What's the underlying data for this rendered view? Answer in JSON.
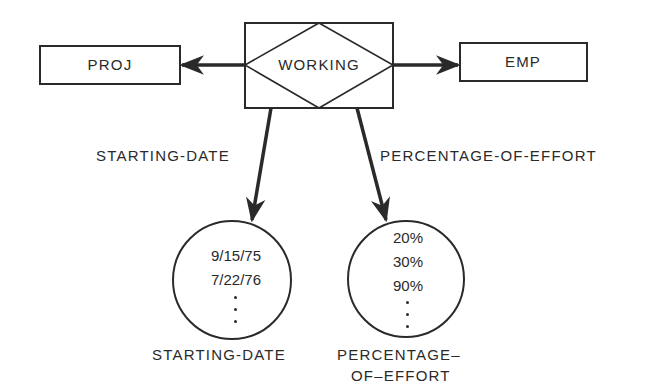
{
  "diagram": {
    "type": "entity-relationship",
    "entities": [
      {
        "id": "proj",
        "label": "PROJ"
      },
      {
        "id": "emp",
        "label": "EMP"
      }
    ],
    "relationship": {
      "id": "working",
      "label": "WORKING"
    },
    "edges": [
      {
        "from": "working",
        "to": "proj"
      },
      {
        "from": "working",
        "to": "emp"
      },
      {
        "from": "working",
        "to": "starting-date-set",
        "label": "STARTING-DATE"
      },
      {
        "from": "working",
        "to": "percentage-of-effort-set",
        "label": "PERCENTAGE-OF-EFFORT"
      }
    ],
    "value_sets": [
      {
        "id": "starting-date-set",
        "caption": "STARTING-DATE",
        "values": [
          "9/15/75",
          "7/22/76"
        ],
        "ellipsis": "..."
      },
      {
        "id": "percentage-of-effort-set",
        "caption_line1": "PERCENTAGE–",
        "caption_line2": "OF–EFFORT",
        "values": [
          "20%",
          "30%",
          "90%"
        ],
        "ellipsis": "..."
      }
    ],
    "arrow_labels": {
      "starting_date": "STARTING-DATE",
      "percentage_of_effort": "PERCENTAGE-OF-EFFORT"
    },
    "colors": {
      "line": "#2a2a2a",
      "background": "#ffffff"
    }
  }
}
